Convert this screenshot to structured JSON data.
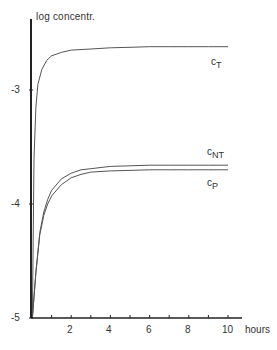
{
  "chart_data": {
    "type": "line",
    "title": "",
    "xlabel": "hours",
    "ylabel": "log concentr.",
    "xlim": [
      0,
      10.8
    ],
    "ylim": [
      -5,
      -2.4
    ],
    "x_ticks": [
      2,
      4,
      6,
      8,
      10
    ],
    "x_minor_ticks": [
      1,
      3,
      5,
      7,
      9
    ],
    "y_ticks": [
      -3,
      -4,
      -5
    ],
    "grid": false,
    "legend": "inline labels at right end of curves",
    "series": [
      {
        "name": "C_T",
        "label_main": "c",
        "label_sub": "T",
        "x": [
          0.02,
          0.1,
          0.2,
          0.3,
          0.5,
          0.75,
          1,
          1.5,
          2,
          3,
          4,
          5,
          6,
          7,
          8,
          9,
          10
        ],
        "y": [
          -5.0,
          -3.6,
          -3.15,
          -2.95,
          -2.82,
          -2.74,
          -2.7,
          -2.67,
          -2.65,
          -2.64,
          -2.63,
          -2.625,
          -2.62,
          -2.62,
          -2.62,
          -2.62,
          -2.62
        ]
      },
      {
        "name": "C_NT",
        "label_main": "c",
        "label_sub": "NT",
        "x": [
          0.02,
          0.2,
          0.4,
          0.6,
          0.8,
          1,
          1.5,
          2,
          2.5,
          3,
          4,
          5,
          6,
          7,
          8,
          9,
          10
        ],
        "y": [
          -5.0,
          -4.6,
          -4.25,
          -4.07,
          -3.96,
          -3.88,
          -3.78,
          -3.73,
          -3.7,
          -3.69,
          -3.67,
          -3.665,
          -3.66,
          -3.66,
          -3.66,
          -3.66,
          -3.66
        ]
      },
      {
        "name": "C_P",
        "label_main": "c",
        "label_sub": "P",
        "x": [
          0.02,
          0.2,
          0.4,
          0.6,
          0.8,
          1,
          1.5,
          2,
          2.5,
          3,
          4,
          5,
          6,
          7,
          8,
          9,
          10
        ],
        "y": [
          -5.0,
          -4.6,
          -4.27,
          -4.1,
          -4.0,
          -3.93,
          -3.83,
          -3.77,
          -3.74,
          -3.72,
          -3.71,
          -3.705,
          -3.7,
          -3.7,
          -3.7,
          -3.7,
          -3.7
        ]
      }
    ]
  },
  "labels": {
    "ylabel": "log concentr.",
    "xunit": "hours",
    "yticks": [
      "-3",
      "-4",
      "-5"
    ],
    "xticks": [
      "2",
      "4",
      "6",
      "8",
      "10"
    ],
    "ct_main": "c",
    "ct_sub": "T",
    "cnt_main": "c",
    "cnt_sub": "NT",
    "cp_main": "c",
    "cp_sub": "P"
  },
  "colors": {
    "axis": "#222222",
    "curve": "#555555",
    "text": "#333333"
  }
}
